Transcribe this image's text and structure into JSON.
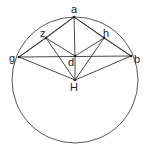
{
  "diagram": {
    "points": [
      {
        "id": "a",
        "label": "a"
      },
      {
        "id": "z",
        "label": "z"
      },
      {
        "id": "h",
        "label": "h"
      },
      {
        "id": "g",
        "label": "g"
      },
      {
        "id": "b",
        "label": "b"
      },
      {
        "id": "d",
        "label": "d"
      },
      {
        "id": "H",
        "label": "H"
      }
    ],
    "segments": [
      [
        "a",
        "g"
      ],
      [
        "a",
        "b"
      ],
      [
        "a",
        "d"
      ],
      [
        "a",
        "z"
      ],
      [
        "a",
        "h"
      ],
      [
        "g",
        "b"
      ],
      [
        "g",
        "z"
      ],
      [
        "h",
        "b"
      ],
      [
        "z",
        "d"
      ],
      [
        "d",
        "h"
      ],
      [
        "z",
        "H"
      ],
      [
        "h",
        "H"
      ],
      [
        "g",
        "H"
      ],
      [
        "b",
        "H"
      ],
      [
        "d",
        "H"
      ]
    ],
    "circle": "circumcircle through a, g, b"
  }
}
